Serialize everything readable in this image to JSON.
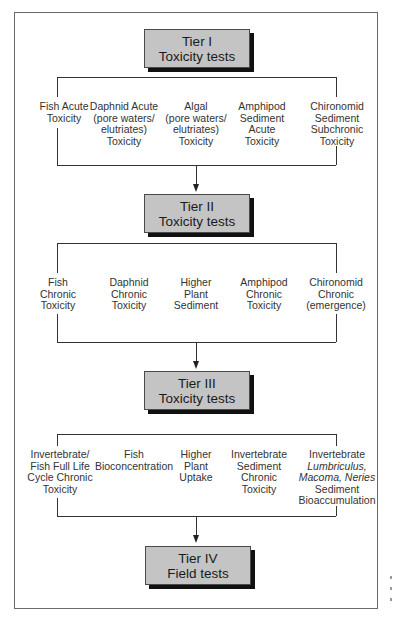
{
  "diagram": {
    "type": "flowchart",
    "tiers": [
      {
        "id": "tier-1",
        "title": "Tier I",
        "subtitle": "Toxicity tests",
        "tests": [
          {
            "lines": [
              "Fish Acute",
              "Toxicity"
            ]
          },
          {
            "lines": [
              "Daphnid Acute",
              "(pore waters/",
              "elutriates)",
              "Toxicity"
            ]
          },
          {
            "lines": [
              "Algal",
              "(pore waters/",
              "elutriates)",
              "Toxicity"
            ]
          },
          {
            "lines": [
              "Amphipod",
              "Sediment",
              "Acute",
              "Toxicity"
            ]
          },
          {
            "lines": [
              "Chironomid",
              "Sediment",
              "Subchronic",
              "Toxicity"
            ]
          }
        ]
      },
      {
        "id": "tier-2",
        "title": "Tier II",
        "subtitle": "Toxicity tests",
        "tests": [
          {
            "lines": [
              "Fish",
              "Chronic",
              "Toxicity"
            ]
          },
          {
            "lines": [
              "Daphnid",
              "Chronic",
              "Toxicity"
            ]
          },
          {
            "lines": [
              "Higher",
              "Plant",
              "Sediment"
            ]
          },
          {
            "lines": [
              "Amphipod",
              "Chronic",
              "Toxicity"
            ]
          },
          {
            "lines": [
              "Chironomid",
              "Chronic",
              "(emergence)"
            ]
          }
        ]
      },
      {
        "id": "tier-3",
        "title": "Tier III",
        "subtitle": "Toxicity tests",
        "tests": [
          {
            "lines": [
              "Invertebrate/",
              "Fish Full Life",
              "Cycle Chronic",
              "Toxicity"
            ]
          },
          {
            "lines": [
              "Fish",
              "Bioconcentration"
            ]
          },
          {
            "lines": [
              "Higher",
              "Plant",
              "Uptake"
            ]
          },
          {
            "lines": [
              "Invertebrate",
              "Sediment",
              "Chronic",
              "Toxicity"
            ]
          },
          {
            "lines": [
              "Invertebrate",
              "Lumbriculus,",
              "Macoma, Neries",
              "Sediment",
              "Bioaccumulation"
            ],
            "italic_lines": [
              1,
              2
            ]
          }
        ]
      },
      {
        "id": "tier-4",
        "title": "Tier IV",
        "subtitle": "Field tests",
        "tests": []
      }
    ],
    "colors": {
      "box_fill": "#c4c4c4",
      "box_shadow": "#111111",
      "lines": "#333333",
      "frame": "#6a6a6a"
    }
  }
}
